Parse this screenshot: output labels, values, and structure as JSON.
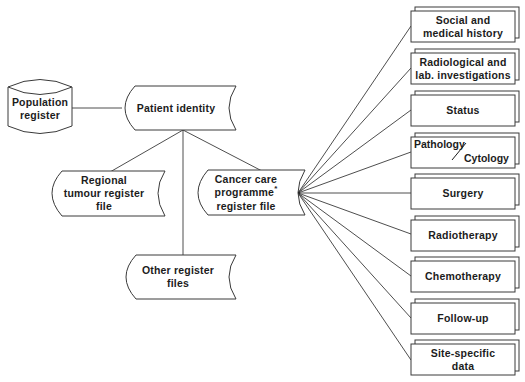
{
  "diagram": {
    "population": {
      "label": "Population\nregister",
      "shape": "cylinder"
    },
    "patient": {
      "label": "Patient identity",
      "shape": "stored-data"
    },
    "regional": {
      "label": "Regional\ntumour register\nfile",
      "shape": "stored-data"
    },
    "cancer": {
      "label_line1": "Cancer care",
      "label_line2": "programme",
      "label_mark": "*",
      "label_line3": "register file",
      "shape": "stored-data"
    },
    "other": {
      "label": "Other register\nfiles",
      "shape": "stored-data"
    },
    "modules": [
      {
        "label": "Social and\nmedical history"
      },
      {
        "label": "Radiological and\nlab. investigations"
      },
      {
        "label": "Status"
      },
      {
        "label_a": "Pathology",
        "label_sep": "/",
        "label_b": "Cytology"
      },
      {
        "label": "Surgery"
      },
      {
        "label": "Radiotherapy"
      },
      {
        "label": "Chemotherapy"
      },
      {
        "label": "Follow-up"
      },
      {
        "label": "Site-specific\ndata"
      }
    ]
  },
  "colors": {
    "line": "#3a3a3a",
    "text": "#1c1c1c",
    "background": "#ffffff"
  }
}
